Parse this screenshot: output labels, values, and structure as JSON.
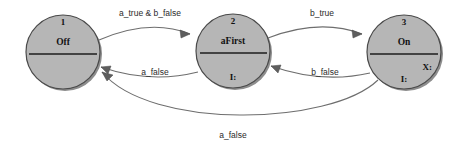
{
  "diagram": {
    "type": "state-transition-diagram",
    "background_color": "#ffffff",
    "node_fill": "#b6b6b6",
    "node_stroke": "#4a4a4a",
    "edge_color": "#6e6e6e"
  },
  "states": [
    {
      "id": "1",
      "name": "Off",
      "slot_center": "",
      "slot_right": "",
      "cx": 63,
      "cy": 52,
      "r": 37
    },
    {
      "id": "2",
      "name": "aFirst",
      "slot_center": "I:",
      "slot_right": "",
      "cx": 233,
      "cy": 51,
      "r": 37
    },
    {
      "id": "3",
      "name": "On",
      "slot_center": "I:",
      "slot_right": "X:",
      "cx": 404,
      "cy": 52,
      "r": 37
    }
  ],
  "transitions": [
    {
      "id": "t1",
      "from": "1",
      "to": "2",
      "label": "a_true & b_false",
      "label_x": 150,
      "label_y": 16
    },
    {
      "id": "t2",
      "from": "2",
      "to": "3",
      "label": "b_true",
      "label_x": 322,
      "label_y": 16
    },
    {
      "id": "t3",
      "from": "2",
      "to": "1",
      "label": "a_false",
      "label_x": 155,
      "label_y": 75
    },
    {
      "id": "t4",
      "from": "3",
      "to": "2",
      "label": "b_false",
      "label_x": 325,
      "label_y": 75
    },
    {
      "id": "t5",
      "from": "3",
      "to": "1",
      "label": "a_false",
      "label_x": 233,
      "label_y": 138
    }
  ]
}
